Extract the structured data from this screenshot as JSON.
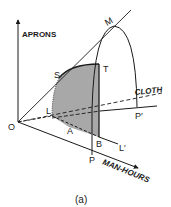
{
  "figure": {
    "caption": "(a)",
    "axes": {
      "vertical": "APRONS",
      "horizontal": "MAN-HOURS",
      "depth": "CLOTH"
    },
    "points": {
      "O": "O",
      "M": "M",
      "S": "S",
      "T": "T",
      "L": "L",
      "A": "A",
      "B": "B",
      "P": "P",
      "P_prime": "P′",
      "L_prime": "L′"
    },
    "colors": {
      "line": "#1a1a1a",
      "shaded_region": "#a8a8a8",
      "background": "#ffffff"
    }
  }
}
